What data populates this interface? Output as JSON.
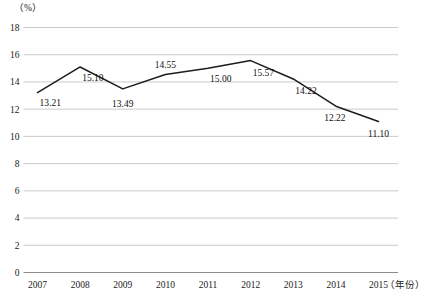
{
  "chart_data": {
    "type": "line",
    "title": "",
    "xlabel": "（年份）",
    "ylabel": "（%）",
    "categories": [
      "2007",
      "2008",
      "2009",
      "2010",
      "2011",
      "2012",
      "2013",
      "2014",
      "2015"
    ],
    "values": [
      13.21,
      15.1,
      13.49,
      14.55,
      15.0,
      15.57,
      14.22,
      12.22,
      11.1
    ],
    "point_labels": [
      "13.21",
      "15.10",
      "13.49",
      "14.55",
      "15.00",
      "15.57",
      "14.22",
      "12.22",
      "11.10"
    ],
    "ylim": [
      0,
      18
    ],
    "ytick_values": [
      18,
      16,
      14,
      12,
      10,
      8,
      6,
      4,
      2,
      0
    ],
    "ytick_labels": [
      "18",
      "16",
      "14",
      "12",
      "10",
      "8",
      "6",
      "4",
      "2",
      "0"
    ],
    "grid": true,
    "legend": "none",
    "series": [
      {
        "name": "",
        "values": [
          13.21,
          15.1,
          13.49,
          14.55,
          15.0,
          15.57,
          14.22,
          12.22,
          11.1
        ],
        "color": "#1c1c1c"
      }
    ],
    "colors": {
      "line": "#1c1c1c",
      "gridline": "#bcbcbc",
      "axis": "#8d8d8d",
      "text": "#1a1a1a",
      "background": "#ffffff"
    }
  }
}
